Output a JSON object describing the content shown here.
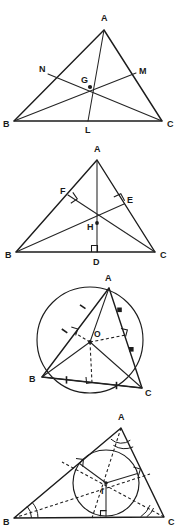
{
  "document": {
    "title": "Triangle centers figure sheet",
    "background_color": "#ffffff",
    "ink_color": "#1c1c1c",
    "panel_count": 4
  },
  "panels": [
    {
      "id": "centroid",
      "name": "medians-centroid",
      "center_label": "G",
      "center_name": "centroid",
      "vertices": [
        {
          "label": "A",
          "x": 104,
          "y": 22
        },
        {
          "label": "B",
          "x": 14,
          "y": 120
        },
        {
          "label": "C",
          "x": 162,
          "y": 120
        }
      ],
      "points": [
        {
          "label": "N",
          "x": 48,
          "y": 73,
          "desc": "midpoint-of-AB"
        },
        {
          "label": "M",
          "x": 136,
          "y": 73,
          "desc": "midpoint-of-AC"
        },
        {
          "label": "L",
          "x": 88,
          "y": 120,
          "desc": "midpoint-of-BC"
        },
        {
          "label": "G",
          "x": 90,
          "y": 86,
          "desc": "centroid"
        }
      ],
      "labels": {
        "A": "A",
        "B": "B",
        "C": "C",
        "N": "N",
        "M": "M",
        "L": "L",
        "G": "G"
      }
    },
    {
      "id": "orthocenter",
      "name": "altitudes-orthocenter",
      "center_label": "H",
      "center_name": "orthocenter",
      "vertices": [
        {
          "label": "A",
          "x": 97,
          "y": 155
        },
        {
          "label": "B",
          "x": 16,
          "y": 252
        },
        {
          "label": "C",
          "x": 155,
          "y": 252
        }
      ],
      "points": [
        {
          "label": "F",
          "x": 70,
          "y": 194,
          "desc": "foot-on-AB"
        },
        {
          "label": "E",
          "x": 122,
          "y": 203,
          "desc": "foot-on-AC"
        },
        {
          "label": "D",
          "x": 97,
          "y": 252,
          "desc": "foot-on-BC"
        },
        {
          "label": "H",
          "x": 97,
          "y": 222,
          "desc": "orthocenter"
        }
      ],
      "labels": {
        "A": "A",
        "B": "B",
        "C": "C",
        "F": "F",
        "E": "E",
        "D": "D",
        "H": "H"
      },
      "right_angle_marks": 3
    },
    {
      "id": "circumcenter",
      "name": "perpendicular-bisectors-circumcenter",
      "center_label": "O",
      "center_name": "circumcenter",
      "vertices": [
        {
          "label": "A",
          "x": 109,
          "y": 288
        },
        {
          "label": "B",
          "x": 42,
          "y": 377
        },
        {
          "label": "C",
          "x": 142,
          "y": 388
        }
      ],
      "points": [
        {
          "label": "O",
          "x": 90,
          "y": 342,
          "desc": "circumcenter"
        }
      ],
      "labels": {
        "A": "A",
        "B": "B",
        "C": "C",
        "O": "O"
      },
      "circle": {
        "cx": 90,
        "cy": 340,
        "r": 53,
        "desc": "circumcircle"
      },
      "right_angle_marks": 3,
      "tick_marks": 6
    },
    {
      "id": "incenter",
      "name": "angle-bisectors-incenter",
      "center_label": "I",
      "center_name": "incenter",
      "vertices": [
        {
          "label": "A",
          "x": 121,
          "y": 428
        },
        {
          "label": "B",
          "x": 14,
          "y": 518
        },
        {
          "label": "C",
          "x": 164,
          "y": 517
        }
      ],
      "points": [
        {
          "label": "I",
          "x": 106,
          "y": 490,
          "desc": "incenter"
        }
      ],
      "labels": {
        "A": "A",
        "B": "B",
        "C": "C",
        "I": "I"
      },
      "circle": {
        "cx": 106,
        "cy": 483,
        "r": 33,
        "desc": "incircle"
      },
      "right_angle_marks": 3,
      "angle_marks": 3
    }
  ]
}
